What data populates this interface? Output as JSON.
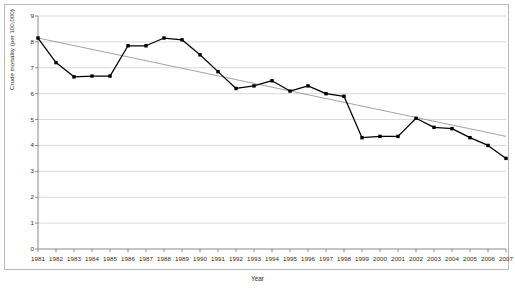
{
  "chart_data": {
    "type": "line",
    "title": "",
    "xlabel": "Year",
    "ylabel": "Crude mortality (per 100,000)",
    "xlim": [
      1981,
      2007
    ],
    "ylim": [
      0,
      9
    ],
    "ytick_step": 1,
    "grid": "horizontal",
    "legend": "none",
    "categories": [
      "1981",
      "1982",
      "1983",
      "1984",
      "1985",
      "1986",
      "1987",
      "1988",
      "1989",
      "1990",
      "1991",
      "1992",
      "1993",
      "1994",
      "1995",
      "1996",
      "1997",
      "1998",
      "1999",
      "2000",
      "2001",
      "2002",
      "2003",
      "2004",
      "2005",
      "2006",
      "2007"
    ],
    "ytick_labels": [
      "0",
      "1",
      "2",
      "3",
      "4",
      "5",
      "6",
      "7",
      "8",
      "9"
    ],
    "series": [
      {
        "name": "Crude mortality",
        "style": "line-with-square-markers",
        "color": "#000000",
        "values": [
          8.15,
          7.2,
          6.65,
          6.68,
          6.68,
          7.85,
          7.85,
          8.15,
          8.08,
          7.5,
          6.85,
          6.2,
          6.3,
          6.5,
          6.1,
          6.3,
          6.0,
          5.9,
          4.3,
          4.35,
          4.35,
          5.05,
          4.7,
          4.65,
          4.3,
          4.0,
          3.5
        ]
      },
      {
        "name": "Linear trend",
        "style": "thin-line",
        "color": "#999999",
        "endpoints": [
          {
            "x": "1981",
            "y": 8.15
          },
          {
            "x": "2007",
            "y": 4.35
          }
        ]
      }
    ]
  },
  "axes": {
    "y_axis_label": "Crude mortality (per 100,000)",
    "x_axis_label": "Year"
  },
  "colors": {
    "series_line": "#000000",
    "trend_line": "#999999",
    "grid": "#cfcfcf",
    "axis": "#808080",
    "frame": "#b9b9b9",
    "text": "#2b2b2b",
    "background": "#ffffff"
  }
}
